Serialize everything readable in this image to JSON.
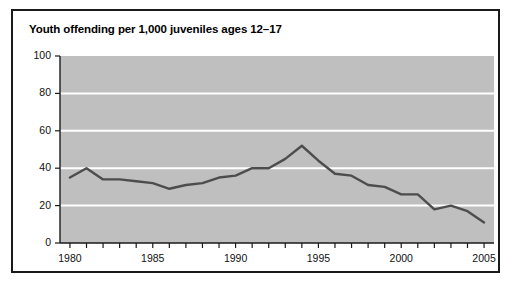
{
  "chart_data": {
    "type": "line",
    "title": "Youth offending per 1,000 juveniles ages 12–17",
    "xlabel": "",
    "ylabel": "",
    "xlim": [
      1979.4,
      2005.6
    ],
    "ylim": [
      0,
      100
    ],
    "grid": true,
    "grid_color": "#ffffff",
    "plot_background": "#bfbfbf",
    "line_color": "#4d4d4d",
    "legend": "none",
    "y_ticks": [
      0,
      20,
      40,
      60,
      80,
      100
    ],
    "y_tick_labels": [
      "0",
      "20",
      "40",
      "60",
      "80",
      "100"
    ],
    "x_ticks": [
      1980,
      1981,
      1982,
      1983,
      1984,
      1985,
      1986,
      1987,
      1988,
      1989,
      1990,
      1991,
      1992,
      1993,
      1994,
      1995,
      1996,
      1997,
      1998,
      1999,
      2000,
      2001,
      2002,
      2003,
      2004,
      2005
    ],
    "x_tick_labels": [
      "1980",
      "1985",
      "1990",
      "1995",
      "2000",
      "2005"
    ],
    "x_tick_label_values": [
      1980,
      1985,
      1990,
      1995,
      2000,
      2005
    ],
    "x": [
      1980,
      1981,
      1982,
      1983,
      1984,
      1985,
      1986,
      1987,
      1988,
      1989,
      1990,
      1991,
      1992,
      1993,
      1994,
      1995,
      1996,
      1997,
      1998,
      1999,
      2000,
      2001,
      2002,
      2003,
      2004,
      2005
    ],
    "values": [
      35,
      40,
      34,
      34,
      33,
      32,
      29,
      31,
      32,
      35,
      36,
      40,
      40,
      45,
      52,
      44,
      37,
      36,
      31,
      30,
      26,
      26,
      18,
      20,
      17,
      11
    ],
    "series": [
      {
        "name": "Youth offending rate",
        "values": [
          35,
          40,
          34,
          34,
          33,
          32,
          29,
          31,
          32,
          35,
          36,
          40,
          40,
          45,
          52,
          44,
          37,
          36,
          31,
          30,
          26,
          26,
          18,
          20,
          17,
          11
        ]
      }
    ]
  },
  "chart": {
    "title": "Youth offending per 1,000 juveniles ages 12–17"
  }
}
